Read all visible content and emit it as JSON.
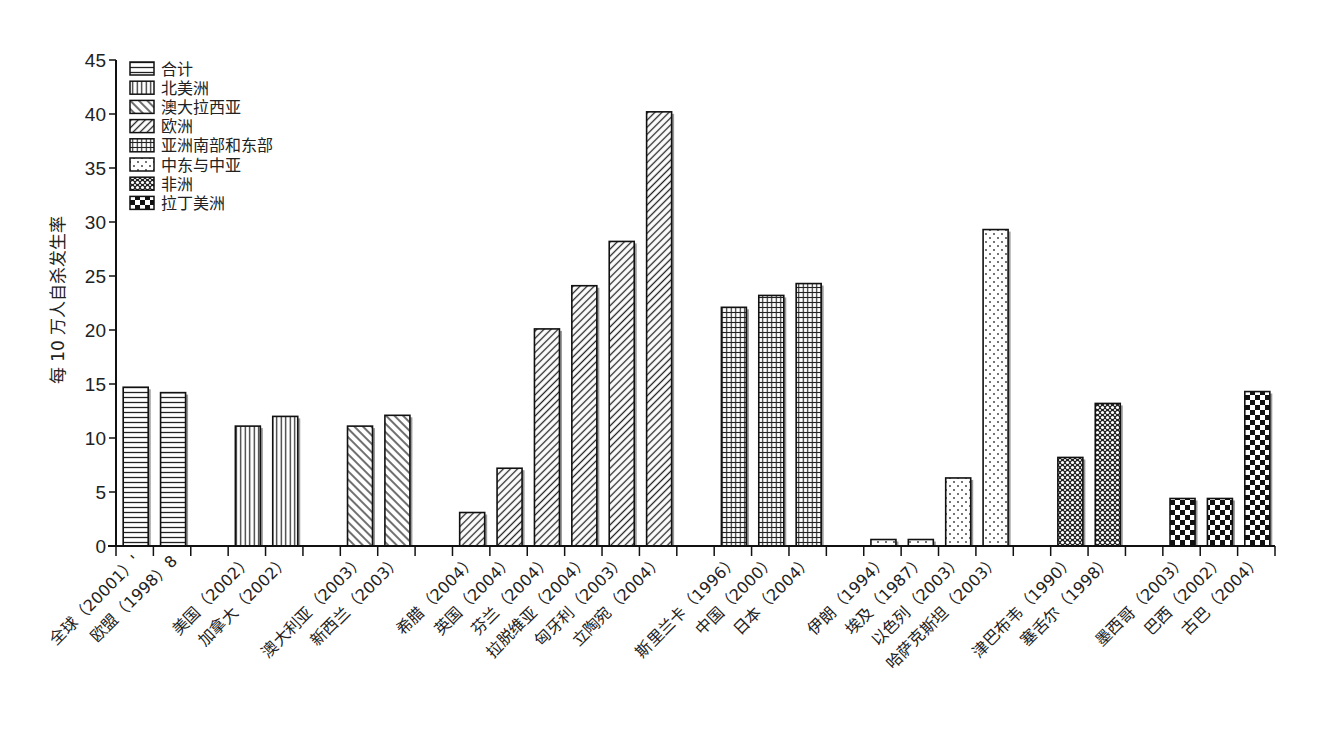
{
  "chart_data": {
    "type": "bar",
    "title": "",
    "xlabel": "",
    "ylabel": "每 10 万人自杀发生率",
    "ylim": [
      0,
      45
    ],
    "yticks": [
      0,
      5,
      10,
      15,
      20,
      25,
      30,
      35,
      40,
      45
    ],
    "grid": false,
    "legend_position": "top-left (inside)",
    "legend": [
      {
        "name": "合计",
        "pattern": "horizontal-lines"
      },
      {
        "name": "北美洲",
        "pattern": "vertical-lines"
      },
      {
        "name": "澳大拉西亚",
        "pattern": "diagonal-forward"
      },
      {
        "name": "欧洲",
        "pattern": "diagonal-backward"
      },
      {
        "name": "亚洲南部和东部",
        "pattern": "grid"
      },
      {
        "name": "中东与中亚",
        "pattern": "dots"
      },
      {
        "name": "非洲",
        "pattern": "crosshatch-circles"
      },
      {
        "name": "拉丁美洲",
        "pattern": "checkerboard"
      }
    ],
    "categories": [
      "全球（20001）'",
      "欧盟（1998）8",
      "美国（2002）",
      "加拿大（2002）",
      "澳大利亚（2003）",
      "新西兰（2003）",
      "希腊（2004）",
      "英国（2004）",
      "芬兰（2004）",
      "拉脱维亚（2004）",
      "匈牙利（2003）",
      "立陶宛（2004）",
      "斯里兰卡（1996）",
      "中国（2000）",
      "日本（2004）",
      "伊朗（1994）",
      "埃及（1987）",
      "以色列（2003）",
      "哈萨克斯坦（2003）",
      "津巴布韦（1990）",
      "塞舌尔（1998）",
      "墨西哥（2003）",
      "巴西（2002）",
      "古巴（2004）"
    ],
    "series": [
      {
        "name": "合计",
        "values": {
          "全球（20001）'": 14.7,
          "欧盟（1998）8": 14.2
        }
      },
      {
        "name": "北美洲",
        "values": {
          "美国（2002）": 11.1,
          "加拿大（2002）": 12.0
        }
      },
      {
        "name": "澳大拉西亚",
        "values": {
          "澳大利亚（2003）": 11.1,
          "新西兰（2003）": 12.1
        }
      },
      {
        "name": "欧洲",
        "values": {
          "希腊（2004）": 3.1,
          "英国（2004）": 7.2,
          "芬兰（2004）": 20.1,
          "拉脱维亚（2004）": 24.1,
          "匈牙利（2003）": 28.2,
          "立陶宛（2004）": 40.2
        }
      },
      {
        "name": "亚洲南部和东部",
        "values": {
          "斯里兰卡（1996）": 22.1,
          "中国（2000）": 23.2,
          "日本（2004）": 24.3
        }
      },
      {
        "name": "中东与中亚",
        "values": {
          "伊朗（1994）": 0.6,
          "埃及（1987）": 0.6,
          "以色列（2003）": 6.3,
          "哈萨克斯坦（2003）": 29.3
        }
      },
      {
        "name": "非洲",
        "values": {
          "津巴布韦（1990）": 8.2,
          "塞舌尔（1998）": 13.2
        }
      },
      {
        "name": "拉丁美洲",
        "values": {
          "墨西哥（2003）": 4.4,
          "巴西（2002）": 4.4,
          "古巴（2004）": 14.3
        }
      }
    ],
    "values": [
      14.7,
      14.2,
      11.1,
      12.0,
      11.1,
      12.1,
      3.1,
      7.2,
      20.1,
      24.1,
      28.2,
      40.2,
      22.1,
      23.2,
      24.3,
      0.6,
      0.6,
      6.3,
      29.3,
      8.2,
      13.2,
      4.4,
      4.4,
      14.3
    ],
    "bars": [
      {
        "slot": 0,
        "label": "全球（20001）'",
        "value": 14.7,
        "group": 0
      },
      {
        "slot": 1,
        "label": "欧盟（1998）8",
        "value": 14.2,
        "group": 0
      },
      {
        "slot": 3,
        "label": "美国（2002）",
        "value": 11.1,
        "group": 1
      },
      {
        "slot": 4,
        "label": "加拿大（2002）",
        "value": 12.0,
        "group": 1
      },
      {
        "slot": 6,
        "label": "澳大利亚（2003）",
        "value": 11.1,
        "group": 2
      },
      {
        "slot": 7,
        "label": "新西兰（2003）",
        "value": 12.1,
        "group": 2
      },
      {
        "slot": 9,
        "label": "希腊（2004）",
        "value": 3.1,
        "group": 3
      },
      {
        "slot": 10,
        "label": "英国（2004）",
        "value": 7.2,
        "group": 3
      },
      {
        "slot": 11,
        "label": "芬兰（2004）",
        "value": 20.1,
        "group": 3
      },
      {
        "slot": 12,
        "label": "拉脱维亚（2004）",
        "value": 24.1,
        "group": 3
      },
      {
        "slot": 13,
        "label": "匈牙利（2003）",
        "value": 28.2,
        "group": 3
      },
      {
        "slot": 14,
        "label": "立陶宛（2004）",
        "value": 40.2,
        "group": 3
      },
      {
        "slot": 16,
        "label": "斯里兰卡（1996）",
        "value": 22.1,
        "group": 4
      },
      {
        "slot": 17,
        "label": "中国（2000）",
        "value": 23.2,
        "group": 4
      },
      {
        "slot": 18,
        "label": "日本（2004）",
        "value": 24.3,
        "group": 4
      },
      {
        "slot": 20,
        "label": "伊朗（1994）",
        "value": 0.6,
        "group": 5
      },
      {
        "slot": 21,
        "label": "埃及（1987）",
        "value": 0.6,
        "group": 5
      },
      {
        "slot": 22,
        "label": "以色列（2003）",
        "value": 6.3,
        "group": 5
      },
      {
        "slot": 23,
        "label": "哈萨克斯坦（2003）",
        "value": 29.3,
        "group": 5
      },
      {
        "slot": 25,
        "label": "津巴布韦（1990）",
        "value": 8.2,
        "group": 6
      },
      {
        "slot": 26,
        "label": "塞舌尔（1998）",
        "value": 13.2,
        "group": 6
      },
      {
        "slot": 28,
        "label": "墨西哥（2003）",
        "value": 4.4,
        "group": 7
      },
      {
        "slot": 29,
        "label": "巴西（2002）",
        "value": 4.4,
        "group": 7
      },
      {
        "slot": 30,
        "label": "古巴（2004）",
        "value": 14.3,
        "group": 7
      }
    ],
    "total_slots": 31
  }
}
